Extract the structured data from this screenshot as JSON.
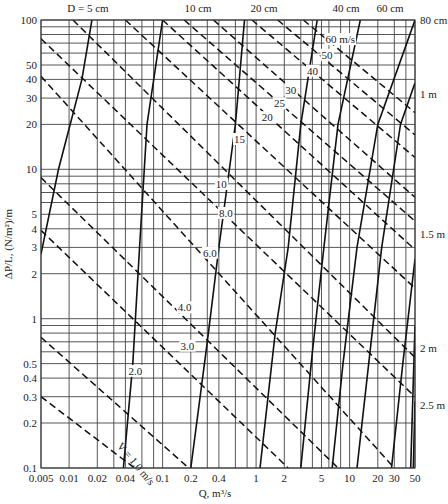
{
  "chart_data": {
    "type": "line",
    "title": "",
    "xlabel": "Q, m³/s",
    "ylabel": "ΔP/L, (N/m²)/m",
    "x_scale": "log",
    "y_scale": "log",
    "xlim": [
      0.005,
      50
    ],
    "ylim": [
      0.1,
      100
    ],
    "grid": true,
    "x_ticks": [
      0.005,
      0.01,
      0.02,
      0.04,
      0.1,
      0.2,
      0.4,
      1,
      2,
      5,
      10,
      20,
      30,
      50
    ],
    "x_tick_labels": [
      "0.005",
      "0.01",
      "0.02",
      "0.04",
      "0.1",
      "0.2",
      "0.4",
      "1",
      "2",
      "5",
      "10",
      "20",
      "30",
      "50"
    ],
    "y_ticks": [
      0.1,
      0.2,
      0.3,
      0.4,
      0.5,
      1,
      2,
      3,
      4,
      5,
      10,
      20,
      30,
      40,
      50,
      100
    ],
    "y_tick_labels": [
      "0.1",
      "0.2",
      "0.3",
      "0.4",
      "0.5",
      "1",
      "2",
      "3",
      "4",
      "5",
      "10",
      "20",
      "30",
      "40",
      "50",
      "100"
    ],
    "x_gridlines": [
      0.005,
      0.01,
      0.02,
      0.03,
      0.04,
      0.06,
      0.08,
      0.1,
      0.2,
      0.3,
      0.4,
      0.6,
      0.8,
      1,
      2,
      3,
      4,
      5,
      6,
      8,
      10,
      20,
      30,
      40,
      50
    ],
    "y_gridlines": [
      0.1,
      0.2,
      0.3,
      0.4,
      0.5,
      0.6,
      0.7,
      0.8,
      0.9,
      1,
      2,
      3,
      4,
      5,
      6,
      7,
      8,
      9,
      10,
      20,
      30,
      40,
      50,
      60,
      70,
      80,
      90,
      100
    ],
    "series_diameter": [
      {
        "name": "D = 5 cm",
        "label": "D = 5 cm",
        "points": [
          [
            0.005,
            2.7
          ],
          [
            0.0077,
            10
          ],
          [
            0.0137,
            40
          ],
          [
            0.0175,
            100
          ]
        ]
      },
      {
        "name": "10 cm",
        "label": "10 cm",
        "points": [
          [
            0.038,
            0.1
          ],
          [
            0.048,
            0.5
          ],
          [
            0.057,
            3.2
          ],
          [
            0.068,
            20
          ],
          [
            0.1,
            100
          ]
        ]
      },
      {
        "name": "20 cm",
        "label": "20 cm",
        "points": [
          [
            0.2,
            0.1
          ],
          [
            0.3,
            0.7
          ],
          [
            0.4,
            3
          ],
          [
            0.6,
            20
          ],
          [
            0.75,
            100
          ]
        ]
      },
      {
        "name": "40 cm",
        "label": "40 cm",
        "points": [
          [
            1.1,
            0.1
          ],
          [
            1.6,
            0.8
          ],
          [
            2.2,
            3
          ],
          [
            3,
            20
          ],
          [
            4.5,
            100
          ]
        ]
      },
      {
        "name": "60 cm",
        "label": "60 cm",
        "points": [
          [
            3,
            0.1
          ],
          [
            4,
            0.6
          ],
          [
            5.3,
            3
          ],
          [
            7.5,
            20
          ],
          [
            13,
            100
          ]
        ]
      },
      {
        "name": "80 cm",
        "label": "80 cm",
        "points": [
          [
            6.5,
            0.1
          ],
          [
            8.5,
            0.5
          ],
          [
            12,
            3
          ],
          [
            20,
            20
          ],
          [
            50,
            100
          ]
        ]
      },
      {
        "name": "1 m",
        "label": "1 m",
        "points": [
          [
            12,
            0.1
          ],
          [
            16,
            0.5
          ],
          [
            22,
            3
          ],
          [
            35,
            20
          ],
          [
            50,
            38
          ]
        ]
      },
      {
        "name": "1.5 m",
        "label": "1.5 m",
        "points": [
          [
            28,
            0.1
          ],
          [
            37,
            0.5
          ],
          [
            50,
            2.5
          ]
        ]
      },
      {
        "name": "2 m",
        "label": "2 m",
        "points": [
          [
            45,
            0.1
          ],
          [
            50,
            0.9
          ]
        ]
      },
      {
        "name": "2.5 m",
        "label": "2.5 m",
        "points": [
          [
            48,
            0.1
          ],
          [
            50,
            0.28
          ]
        ]
      }
    ],
    "series_velocity": [
      {
        "name": "V = 1.0 m/s",
        "label": "V = 1.0 m/s",
        "points": [
          [
            0.005,
            0.3
          ],
          [
            0.05,
            0.1
          ]
        ]
      },
      {
        "name": "2.0 m/s",
        "label": "2.0",
        "points": [
          [
            0.005,
            0.75
          ],
          [
            0.19,
            0.1
          ]
        ]
      },
      {
        "name": "3.0 m/s",
        "label": "3.0",
        "points": [
          [
            0.005,
            3.9
          ],
          [
            2.2,
            0.1
          ]
        ]
      },
      {
        "name": "4.0 m/s",
        "label": "4.0",
        "points": [
          [
            0.005,
            8.8
          ],
          [
            7.5,
            0.1
          ]
        ]
      },
      {
        "name": "6.0 m/s",
        "label": "6.0",
        "points": [
          [
            0.005,
            42
          ],
          [
            30,
            0.1
          ]
        ]
      },
      {
        "name": "8.0 m/s",
        "label": "8.0",
        "points": [
          [
            0.005,
            75
          ],
          [
            50,
            0.3
          ]
        ]
      },
      {
        "name": "10 m/s",
        "label": "10",
        "points": [
          [
            0.011,
            100
          ],
          [
            50,
            0.55
          ]
        ]
      },
      {
        "name": "15 m/s",
        "label": "15",
        "points": [
          [
            0.04,
            100
          ],
          [
            50,
            1.6
          ]
        ]
      },
      {
        "name": "20 m/s",
        "label": "20",
        "points": [
          [
            0.1,
            100
          ],
          [
            50,
            2.9
          ]
        ]
      },
      {
        "name": "25 m/s",
        "label": "25",
        "points": [
          [
            0.17,
            100
          ],
          [
            50,
            4.5
          ]
        ]
      },
      {
        "name": "30 m/s",
        "label": "30",
        "points": [
          [
            0.35,
            100
          ],
          [
            50,
            6.5
          ]
        ]
      },
      {
        "name": "40 m/s",
        "label": "40",
        "points": [
          [
            0.9,
            100
          ],
          [
            50,
            12
          ]
        ]
      },
      {
        "name": "50 m/s",
        "label": "50",
        "points": [
          [
            1.7,
            100
          ],
          [
            50,
            17
          ]
        ]
      },
      {
        "name": "60 m/s",
        "label": "60 m/s",
        "points": [
          [
            3.2,
            100
          ],
          [
            50,
            24
          ]
        ]
      }
    ],
    "velocity_label_positions": [
      {
        "label": "V = 1.0 m/s",
        "x": 0.032,
        "y": 0.14,
        "rotate": 50
      },
      {
        "label": "2.0",
        "x": 0.043,
        "y": 0.42,
        "rotate": 0
      },
      {
        "label": "3.0",
        "x": 0.155,
        "y": 0.62,
        "rotate": 0
      },
      {
        "label": "4.0",
        "x": 0.145,
        "y": 1.12,
        "rotate": 0
      },
      {
        "label": "6.0",
        "x": 0.27,
        "y": 2.6,
        "rotate": 0
      },
      {
        "label": "8.0",
        "x": 0.4,
        "y": 4.8,
        "rotate": 0
      },
      {
        "label": "10",
        "x": 0.37,
        "y": 7.5,
        "rotate": 0
      },
      {
        "label": "15",
        "x": 0.58,
        "y": 15,
        "rotate": 0
      },
      {
        "label": "20",
        "x": 1.15,
        "y": 21,
        "rotate": 0
      },
      {
        "label": "25",
        "x": 1.55,
        "y": 26,
        "rotate": 0
      },
      {
        "label": "30",
        "x": 2.05,
        "y": 32,
        "rotate": 0
      },
      {
        "label": "40",
        "x": 3.5,
        "y": 43,
        "rotate": 0
      },
      {
        "label": "50",
        "x": 5.0,
        "y": 55,
        "rotate": 0
      },
      {
        "label": "60 m/s",
        "x": 5.5,
        "y": 70,
        "rotate": 0
      }
    ],
    "diameter_label_positions": [
      {
        "label": "D = 5 cm",
        "px": 88,
        "py": 12
      },
      {
        "label": "10 cm",
        "px": 198,
        "py": 12
      },
      {
        "label": "20 cm",
        "px": 264,
        "py": 12
      },
      {
        "label": "40 cm",
        "px": 346,
        "py": 12
      },
      {
        "label": "60 cm",
        "px": 390,
        "py": 12
      },
      {
        "label": "80 cm",
        "px": 420,
        "py": 24
      },
      {
        "label": "1 m",
        "px": 420,
        "py": 98
      },
      {
        "label": "1.5 m",
        "px": 420,
        "py": 238
      },
      {
        "label": "2 m",
        "px": 420,
        "py": 352
      },
      {
        "label": "2.5 m",
        "px": 420,
        "py": 409
      }
    ]
  },
  "axes": {
    "x_title": "Q, m³/s",
    "y_title": "ΔP/L, (N/m²)/m"
  },
  "colors": {
    "line": "#111111",
    "grid": "#444444",
    "text": "#222222",
    "background": "#ffffff"
  }
}
